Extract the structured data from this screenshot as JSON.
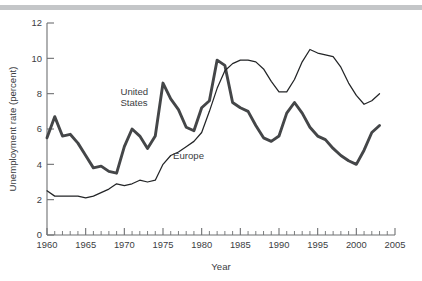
{
  "figure": {
    "background_color": "#ffffff",
    "rule_color": "#c4c6c8"
  },
  "chart_data": {
    "type": "line",
    "title": "",
    "xlabel": "Year",
    "ylabel": "Unemployment rate (percent)",
    "xlim": [
      1960,
      2005
    ],
    "ylim": [
      0,
      12
    ],
    "xticks": [
      1960,
      1965,
      1970,
      1975,
      1980,
      1985,
      1990,
      1995,
      2000,
      2005
    ],
    "xtick_labels": [
      "1960",
      "1965",
      "1970",
      "1975",
      "1980",
      "1985",
      "1990",
      "1995",
      "2000",
      "2005"
    ],
    "xminor_tick_step": 1,
    "yticks": [
      0,
      2,
      4,
      6,
      8,
      10,
      12
    ],
    "ytick_labels": [
      "0",
      "2",
      "4",
      "6",
      "8",
      "10",
      "12"
    ],
    "grid": false,
    "legend_position": "inline-annotation",
    "x": [
      1960,
      1961,
      1962,
      1963,
      1964,
      1965,
      1966,
      1967,
      1968,
      1969,
      1970,
      1971,
      1972,
      1973,
      1974,
      1975,
      1976,
      1977,
      1978,
      1979,
      1980,
      1981,
      1982,
      1983,
      1984,
      1985,
      1986,
      1987,
      1988,
      1989,
      1990,
      1991,
      1992,
      1993,
      1994,
      1995,
      1996,
      1997,
      1998,
      1999,
      2000,
      2001,
      2002,
      2003
    ],
    "series": [
      {
        "name": "United States",
        "color": "#444648",
        "line_width": 2.9,
        "label_position": {
          "x": 1969.5,
          "y": 7.9
        },
        "values": [
          5.5,
          6.7,
          5.6,
          5.7,
          5.2,
          4.5,
          3.8,
          3.9,
          3.6,
          3.5,
          5.0,
          6.0,
          5.6,
          4.9,
          5.6,
          8.6,
          7.7,
          7.1,
          6.1,
          5.9,
          7.2,
          7.6,
          9.9,
          9.6,
          7.5,
          7.2,
          7.0,
          6.2,
          5.5,
          5.3,
          5.6,
          6.9,
          7.5,
          6.9,
          6.1,
          5.6,
          5.4,
          4.9,
          4.5,
          4.2,
          4.0,
          4.8,
          5.8,
          6.2
        ]
      },
      {
        "name": "Europe",
        "color": "#232527",
        "line_width": 1.25,
        "label_position": {
          "x": 1976.3,
          "y": 4.3
        },
        "values": [
          2.5,
          2.2,
          2.2,
          2.2,
          2.2,
          2.1,
          2.2,
          2.4,
          2.6,
          2.9,
          2.8,
          2.9,
          3.1,
          3.0,
          3.1,
          4.0,
          4.5,
          4.7,
          5.0,
          5.3,
          5.8,
          7.0,
          8.3,
          9.3,
          9.7,
          9.9,
          9.9,
          9.8,
          9.4,
          8.7,
          8.1,
          8.1,
          8.8,
          9.8,
          10.5,
          10.3,
          10.2,
          10.1,
          9.5,
          8.6,
          7.9,
          7.4,
          7.6,
          8.0
        ]
      }
    ]
  },
  "axis_titles": {
    "x": "Year",
    "y": "Unemployment rate (percent)"
  }
}
